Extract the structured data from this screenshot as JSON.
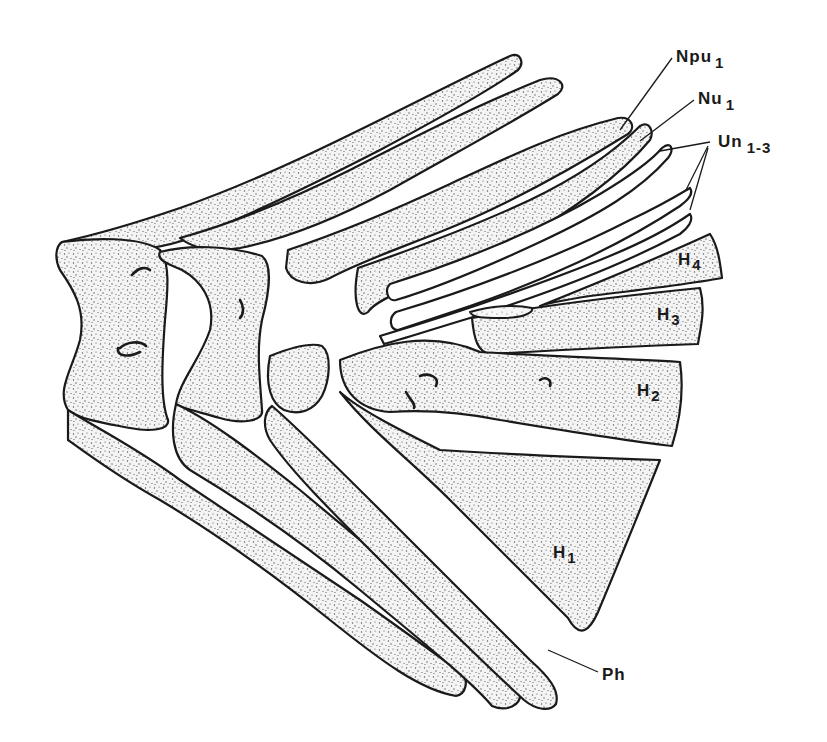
{
  "figure": {
    "type": "anatomical line drawing",
    "colors": {
      "ink": "#1a1a1a",
      "background": "#ffffff",
      "stipple": "#555555"
    }
  },
  "labels": [
    {
      "id": "npu1",
      "main": "Npu",
      "sub": "1",
      "x": 676,
      "y": 62
    },
    {
      "id": "nu1",
      "main": "Nu",
      "sub": "1",
      "x": 698,
      "y": 104
    },
    {
      "id": "un13",
      "main": "Un",
      "sub": "1-3",
      "x": 718,
      "y": 147
    },
    {
      "id": "h4",
      "main": "H",
      "sub": "4",
      "x": 678,
      "y": 265
    },
    {
      "id": "h3",
      "main": "H",
      "sub": "3",
      "x": 657,
      "y": 320
    },
    {
      "id": "h2",
      "main": "H",
      "sub": "2",
      "x": 637,
      "y": 396
    },
    {
      "id": "h1",
      "main": "H",
      "sub": "1",
      "x": 553,
      "y": 558
    },
    {
      "id": "ph",
      "main": "Ph",
      "sub": "",
      "x": 602,
      "y": 680
    }
  ]
}
